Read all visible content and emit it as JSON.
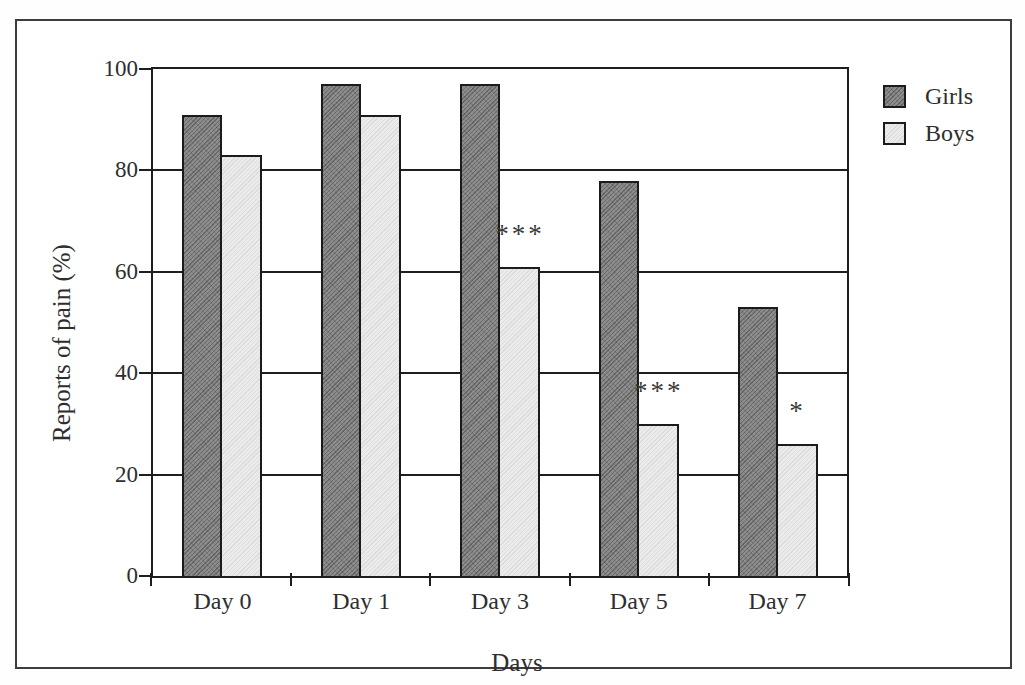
{
  "page": {
    "background": "#ffffff",
    "frame_border_color": "#3d3d3d",
    "axis_color": "#1e1e1e",
    "text_color": "#2e2e2e"
  },
  "chart_data": {
    "type": "bar",
    "title": "",
    "xlabel": "Days",
    "ylabel": "Reports of pain (%)",
    "categories": [
      "Day 0",
      "Day 1",
      "Day 3",
      "Day 5",
      "Day 7"
    ],
    "series": [
      {
        "name": "Girls",
        "fill": "#8d8d8d",
        "hatch": "dark-diagonal",
        "values": [
          91,
          97,
          97,
          78,
          53
        ]
      },
      {
        "name": "Boys",
        "fill": "#ebebeb",
        "hatch": "light-diagonal",
        "values": [
          83,
          91,
          61,
          30,
          26
        ]
      }
    ],
    "ylim": [
      0,
      100
    ],
    "yticks": [
      0,
      20,
      40,
      60,
      80,
      100
    ],
    "grid": "horizontal",
    "legend": {
      "position": "top-right"
    },
    "annotations": [
      {
        "category": "Day 3",
        "series": "Boys",
        "text": "***"
      },
      {
        "category": "Day 5",
        "series": "Boys",
        "text": "***"
      },
      {
        "category": "Day 7",
        "series": "Boys",
        "text": "*"
      }
    ]
  }
}
